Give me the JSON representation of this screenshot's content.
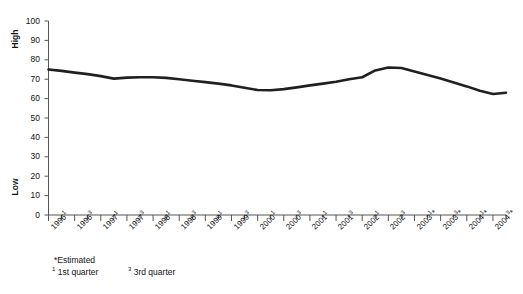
{
  "chart_data": {
    "type": "line",
    "title": "",
    "xlabel": "",
    "ylabel": "",
    "ylim": [
      0,
      100
    ],
    "xlim": [
      0,
      35
    ],
    "grid": false,
    "legend": null,
    "y_ticks": [
      0,
      10,
      20,
      30,
      40,
      50,
      60,
      70,
      80,
      90,
      100
    ],
    "y_axis_top_label": "High",
    "y_axis_bottom_label": "Low",
    "categories": [
      "1996¹",
      "1996³",
      "1997¹",
      "1997³",
      "1998¹",
      "1998³",
      "1999¹",
      "1999³",
      "2000¹",
      "2000³",
      "2001¹",
      "2001³",
      "2002¹",
      "2002³",
      "2003¹*",
      "2003³*",
      "2004¹*",
      "2004³*"
    ],
    "category_parts": [
      {
        "year": "1996",
        "quarter": "1",
        "estimated": false
      },
      {
        "year": "1996",
        "quarter": "3",
        "estimated": false
      },
      {
        "year": "1997",
        "quarter": "1",
        "estimated": false
      },
      {
        "year": "1997",
        "quarter": "3",
        "estimated": false
      },
      {
        "year": "1998",
        "quarter": "1",
        "estimated": false
      },
      {
        "year": "1998",
        "quarter": "3",
        "estimated": false
      },
      {
        "year": "1999",
        "quarter": "1",
        "estimated": false
      },
      {
        "year": "1999",
        "quarter": "3",
        "estimated": false
      },
      {
        "year": "2000",
        "quarter": "1",
        "estimated": false
      },
      {
        "year": "2000",
        "quarter": "3",
        "estimated": false
      },
      {
        "year": "2001",
        "quarter": "1",
        "estimated": false
      },
      {
        "year": "2001",
        "quarter": "3",
        "estimated": false
      },
      {
        "year": "2002",
        "quarter": "1",
        "estimated": false
      },
      {
        "year": "2002",
        "quarter": "3",
        "estimated": false
      },
      {
        "year": "2003",
        "quarter": "1",
        "estimated": true
      },
      {
        "year": "2003",
        "quarter": "3",
        "estimated": true
      },
      {
        "year": "2004",
        "quarter": "1",
        "estimated": true
      },
      {
        "year": "2004",
        "quarter": "3",
        "estimated": true
      }
    ],
    "series": [
      {
        "name": "Index",
        "color": "#231f20",
        "x": [
          0,
          1,
          2,
          3,
          4,
          5,
          6,
          7,
          8,
          9,
          10,
          11,
          12,
          13,
          14,
          15,
          16,
          17,
          18,
          19,
          20,
          21,
          22,
          23,
          24,
          25,
          26,
          27,
          28,
          29,
          30,
          31,
          32,
          33,
          34,
          35
        ],
        "values": [
          75.0,
          74.3,
          73.4,
          72.6,
          71.6,
          70.3,
          70.8,
          71.0,
          71.0,
          70.7,
          70.0,
          69.2,
          68.5,
          67.7,
          66.8,
          65.6,
          64.4,
          64.3,
          64.9,
          65.8,
          66.8,
          67.7,
          68.7,
          70.0,
          71.0,
          74.5,
          76.0,
          75.8,
          74.0,
          72.2,
          70.3,
          68.3,
          66.3,
          64.0,
          62.4,
          63.0
        ]
      }
    ],
    "annotations": []
  },
  "footnotes": {
    "estimated": "*Estimated",
    "q1_marker": "1",
    "q1_label": "1st quarter",
    "q3_marker": "3",
    "q3_label": "3rd quarter"
  },
  "caption": {
    "partial_text": ""
  },
  "style": {
    "line_color": "#231f20",
    "axis_color": "#555555",
    "text_color": "#111111",
    "background": "#ffffff"
  }
}
